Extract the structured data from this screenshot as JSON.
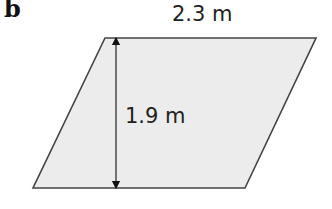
{
  "part_label": "b",
  "shape": {
    "type": "parallelogram",
    "fill": "#ececec",
    "stroke": "#444444",
    "vertices": {
      "top_left": [
        105,
        38
      ],
      "top_right": [
        316,
        38
      ],
      "bottom_right": [
        245,
        188
      ],
      "bottom_left": [
        33,
        188
      ]
    }
  },
  "dimensions": {
    "base": {
      "label": "2.3 m",
      "value": 2.3,
      "unit": "m"
    },
    "height": {
      "label": "1.9 m",
      "value": 1.9,
      "unit": "m"
    }
  }
}
